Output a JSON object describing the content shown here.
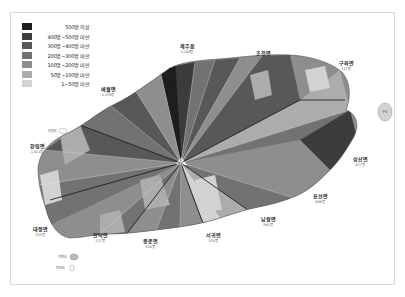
{
  "legend": {
    "items": [
      {
        "label": "500명 이상",
        "color": "#1e1e1e"
      },
      {
        "label": "400명~500명 미만",
        "color": "#3c3c3c"
      },
      {
        "label": "300명~400명 미만",
        "color": "#585858"
      },
      {
        "label": "200명~300명 미만",
        "color": "#727272"
      },
      {
        "label": "100명~200명 미만",
        "color": "#8e8e8e"
      },
      {
        "label": "50명~100명 미만",
        "color": "#acacac"
      },
      {
        "label": "1~50명 미만",
        "color": "#d2d2d2"
      }
    ]
  },
  "towns": [
    {
      "name": "제주읍",
      "sub": "1,240명",
      "x": 187,
      "y": 48
    },
    {
      "name": "조천면",
      "sub": "1,860명",
      "x": 263,
      "y": 55
    },
    {
      "name": "구좌면",
      "sub": "317명",
      "x": 346,
      "y": 65
    },
    {
      "name": "애월면",
      "sub": "1,570명",
      "x": 108,
      "y": 91
    },
    {
      "name": "한림면",
      "sub": "1,011명",
      "x": 37,
      "y": 148
    },
    {
      "name": "성산면",
      "sub": "477명",
      "x": 360,
      "y": 161
    },
    {
      "name": "표선면",
      "sub": "606명",
      "x": 320,
      "y": 198
    },
    {
      "name": "남원면",
      "sub": "563명",
      "x": 268,
      "y": 221
    },
    {
      "name": "대정면",
      "sub": "333명",
      "x": 40,
      "y": 231
    },
    {
      "name": "안덕면",
      "sub": "227명",
      "x": 100,
      "y": 237
    },
    {
      "name": "중문면",
      "sub": "518명",
      "x": 150,
      "y": 243
    },
    {
      "name": "서귀면",
      "sub": "374명",
      "x": 213,
      "y": 237
    }
  ],
  "islands": [
    {
      "name": "우도",
      "x": 385,
      "y": 110
    },
    {
      "name": "비양도",
      "x": 52,
      "y": 131
    },
    {
      "name": "가파도",
      "x": 70,
      "y": 256
    },
    {
      "name": "마라도",
      "x": 65,
      "y": 267
    }
  ]
}
